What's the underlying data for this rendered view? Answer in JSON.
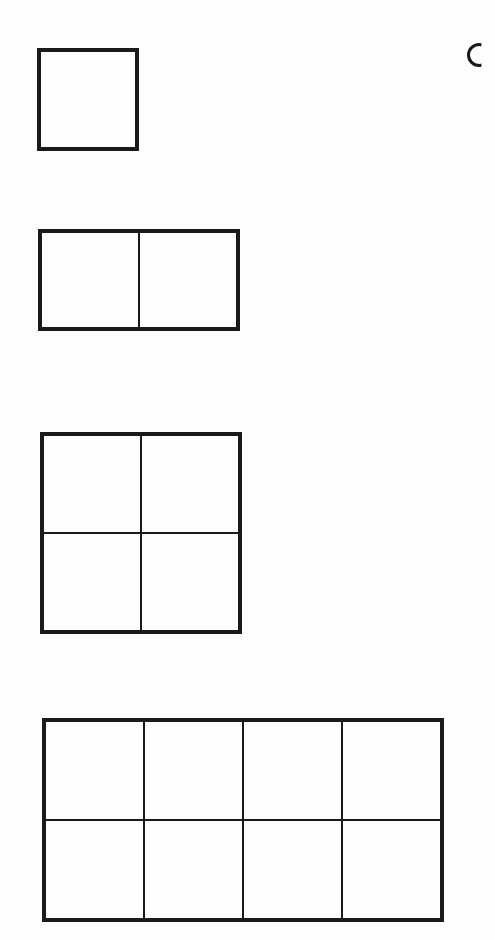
{
  "diagram": {
    "line_color": "#1a1a1a",
    "background_color": "#fdfdfd",
    "grids": [
      {
        "id": "grid-1",
        "rows": 1,
        "cols": 1,
        "cells": 1,
        "x": 37,
        "y": 48,
        "width": 102,
        "height": 103
      },
      {
        "id": "grid-2",
        "rows": 1,
        "cols": 2,
        "cells": 2,
        "x": 38,
        "y": 229,
        "width": 202,
        "height": 102
      },
      {
        "id": "grid-4",
        "rows": 2,
        "cols": 2,
        "cells": 4,
        "x": 40,
        "y": 432,
        "width": 202,
        "height": 202
      },
      {
        "id": "grid-8",
        "rows": 2,
        "cols": 4,
        "cells": 8,
        "x": 42,
        "y": 718,
        "width": 402,
        "height": 204
      }
    ],
    "edge_glyph": {
      "shape": "partial-circle",
      "clipped_at": "right-edge"
    }
  }
}
